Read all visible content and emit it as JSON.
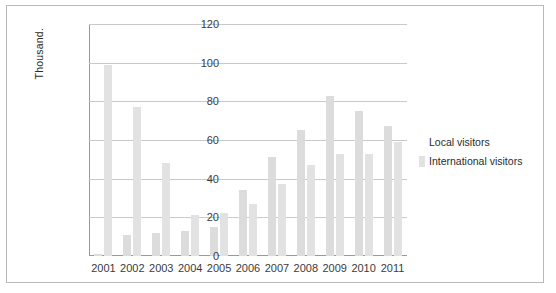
{
  "chart_data": {
    "type": "bar",
    "title": "",
    "xlabel": "",
    "ylabel": "Thousand.",
    "ylim": [
      0,
      120
    ],
    "yticks": [
      0,
      20,
      40,
      60,
      80,
      100,
      120
    ],
    "grid": true,
    "legend_position": "right",
    "categories": [
      "2001",
      "2002",
      "2003",
      "2004",
      "2005",
      "2006",
      "2007",
      "2008",
      "2009",
      "2010",
      "2011"
    ],
    "series": [
      {
        "name": "Local visitors",
        "color": "#dcdcdc",
        "values": [
          1,
          11,
          12,
          13,
          15,
          34,
          51,
          65,
          83,
          75,
          67
        ]
      },
      {
        "name": "International visitors",
        "color": "#e2e2e2",
        "values": [
          99,
          77,
          48,
          21,
          22,
          27,
          37,
          47,
          53,
          53,
          59
        ]
      }
    ]
  },
  "legend": {
    "items": [
      {
        "label": "Local visitors"
      },
      {
        "label": "International visitors"
      }
    ]
  }
}
